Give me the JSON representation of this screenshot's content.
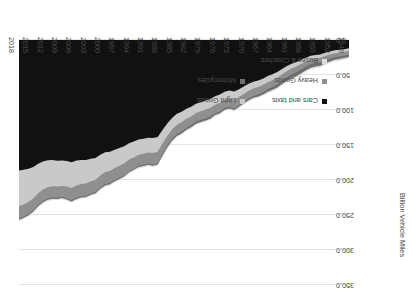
{
  "chart_data": {
    "type": "area",
    "title": "",
    "subtitle": "",
    "xlabel": "",
    "ylabel": "Billion Vehicle Miles",
    "ylim": [
      0,
      350
    ],
    "yticks": [
      "0.0",
      "50.0",
      "100.0",
      "150.0",
      "200.0",
      "250.0",
      "300.0",
      "350.0"
    ],
    "ytick_values": [
      0,
      50,
      100,
      150,
      200,
      250,
      300,
      350
    ],
    "grid": true,
    "legend_position": "lower-right",
    "orientation": "rotated-180",
    "xtick_labels": [
      "1949",
      "1952",
      "1955",
      "1958",
      "1961",
      "1964",
      "1967",
      "1970",
      "1973",
      "1976",
      "1979",
      "1982",
      "1985",
      "1988",
      "1991",
      "1994",
      "1997",
      "2000",
      "2003",
      "2006",
      "2009",
      "2012",
      "2015",
      "2018"
    ],
    "x": [
      1949,
      1950,
      1951,
      1952,
      1953,
      1954,
      1955,
      1956,
      1957,
      1958,
      1959,
      1960,
      1961,
      1962,
      1963,
      1964,
      1965,
      1966,
      1967,
      1968,
      1969,
      1970,
      1971,
      1972,
      1973,
      1974,
      1975,
      1976,
      1977,
      1978,
      1979,
      1980,
      1981,
      1982,
      1983,
      1984,
      1985,
      1986,
      1987,
      1988,
      1989,
      1990,
      1991,
      1992,
      1993,
      1994,
      1995,
      1996,
      1997,
      1998,
      1999,
      2000,
      2001,
      2002,
      2003,
      2004,
      2005,
      2006,
      2007,
      2008,
      2009,
      2010,
      2011,
      2012,
      2013,
      2014,
      2015,
      2016,
      2017,
      2018
    ],
    "series": [
      {
        "name": "Cars and taxis",
        "color": "#111111",
        "values": [
          11.9,
          13.2,
          14.0,
          14.8,
          16.5,
          18.3,
          20.6,
          21.5,
          22.4,
          25.2,
          28.2,
          31.3,
          34.0,
          37.3,
          41.3,
          45.7,
          48.9,
          51.6,
          55.2,
          57.7,
          59.5,
          62.4,
          66.5,
          70.3,
          73.6,
          72.2,
          74.0,
          78.0,
          80.2,
          84.4,
          86.3,
          88.8,
          91.2,
          95.4,
          98.2,
          102.5,
          105.4,
          111.4,
          119.2,
          128.4,
          138.6,
          140.0,
          139.6,
          141.0,
          142.2,
          145.1,
          147.5,
          151.8,
          154.4,
          156.7,
          159.5,
          160.4,
          164.0,
          168.5,
          169.8,
          171.5,
          171.6,
          172.3,
          174.6,
          173.0,
          172.3,
          172.4,
          171.4,
          171.9,
          173.5,
          176.8,
          181.3,
          184.0,
          185.5,
          186.5
        ]
      },
      {
        "name": "Light Goods",
        "color": "#c9c9c9",
        "values": [
          3.6,
          3.8,
          4.0,
          4.1,
          4.3,
          4.6,
          4.9,
          5.0,
          5.2,
          5.6,
          6.0,
          6.5,
          6.8,
          7.2,
          7.7,
          8.2,
          8.5,
          8.8,
          9.2,
          9.5,
          9.7,
          10.1,
          10.6,
          11.1,
          11.7,
          11.5,
          11.5,
          11.9,
          12.2,
          12.7,
          13.0,
          13.0,
          13.2,
          13.8,
          14.4,
          15.0,
          15.7,
          16.6,
          18.0,
          19.6,
          21.2,
          21.5,
          21.2,
          21.5,
          21.8,
          22.6,
          23.3,
          24.4,
          25.3,
          26.2,
          27.5,
          28.3,
          29.5,
          31.0,
          32.1,
          33.4,
          34.2,
          35.4,
          36.8,
          36.3,
          36.2,
          37.0,
          37.6,
          38.6,
          40.2,
          42.2,
          45.0,
          47.6,
          49.5,
          51.1
        ]
      },
      {
        "name": "Heavy Goods",
        "color": "#8f8f8f",
        "values": [
          5.2,
          5.4,
          5.6,
          5.7,
          5.9,
          6.2,
          6.6,
          6.5,
          6.7,
          7.1,
          7.6,
          8.1,
          8.4,
          8.6,
          9.0,
          9.5,
          9.8,
          10.0,
          10.3,
          10.6,
          10.8,
          11.2,
          11.5,
          11.8,
          12.4,
          12.0,
          11.7,
          12.1,
          12.3,
          12.6,
          12.9,
          12.3,
          12.0,
          12.4,
          12.7,
          13.1,
          13.3,
          13.6,
          14.3,
          15.3,
          16.2,
          16.3,
          15.7,
          15.7,
          15.8,
          16.2,
          16.6,
          17.0,
          17.2,
          17.2,
          17.4,
          17.3,
          17.3,
          17.5,
          17.4,
          17.6,
          17.4,
          17.5,
          17.6,
          17.0,
          15.6,
          16.1,
          16.1,
          16.0,
          16.3,
          16.8,
          17.0,
          17.2,
          17.3,
          17.4
        ]
      },
      {
        "name": "Motorcycles",
        "color": "#6e6e6e",
        "values": [
          3.1,
          3.3,
          3.5,
          3.6,
          3.9,
          4.2,
          4.6,
          4.9,
          5.2,
          5.4,
          5.8,
          5.9,
          5.6,
          5.2,
          4.8,
          4.4,
          4.0,
          3.6,
          3.2,
          2.9,
          2.6,
          2.4,
          2.2,
          2.1,
          2.2,
          2.3,
          2.4,
          2.5,
          2.6,
          2.7,
          2.8,
          3.2,
          3.3,
          3.2,
          3.0,
          2.8,
          2.6,
          2.4,
          2.2,
          2.1,
          2.0,
          1.9,
          1.8,
          1.7,
          1.6,
          1.6,
          1.6,
          1.6,
          1.6,
          1.6,
          1.7,
          1.8,
          1.8,
          1.8,
          1.8,
          1.8,
          1.8,
          1.8,
          1.8,
          1.7,
          1.7,
          1.7,
          1.7,
          1.7,
          1.7,
          1.7,
          1.7,
          1.7,
          1.7,
          1.7
        ]
      },
      {
        "name": "Buses & Coaches",
        "color": "#dcdcdc",
        "values": [
          2.4,
          2.4,
          2.4,
          2.4,
          2.4,
          2.3,
          2.3,
          2.3,
          2.2,
          2.2,
          2.2,
          2.1,
          2.1,
          2.1,
          2.0,
          2.0,
          2.0,
          2.0,
          1.9,
          1.9,
          1.9,
          1.9,
          1.8,
          1.8,
          1.8,
          1.8,
          1.8,
          1.8,
          1.8,
          1.8,
          1.8,
          1.8,
          1.8,
          1.8,
          1.8,
          1.8,
          1.8,
          1.8,
          1.8,
          1.8,
          1.8,
          1.8,
          1.8,
          1.8,
          1.8,
          1.8,
          1.8,
          1.8,
          1.8,
          1.8,
          1.8,
          1.8,
          1.8,
          1.8,
          1.8,
          1.8,
          1.8,
          1.8,
          1.8,
          1.8,
          1.8,
          1.8,
          1.8,
          1.8,
          1.8,
          1.8,
          1.8,
          1.8,
          1.8,
          1.8
        ]
      }
    ]
  },
  "axis": {
    "y_title": "Billion Vehicle Miles",
    "y_ticks": [
      "0.0",
      "50.0",
      "100.0",
      "150.0",
      "200.0",
      "250.0",
      "300.0",
      "350.0"
    ],
    "x_ticks": [
      "1949",
      "1952",
      "1955",
      "1958",
      "1961",
      "1964",
      "1967",
      "1970",
      "1973",
      "1976",
      "1979",
      "1982",
      "1985",
      "1988",
      "1991",
      "1994",
      "1997",
      "2000",
      "2003",
      "2006",
      "2009",
      "2012",
      "2015",
      "2018"
    ]
  },
  "legend": {
    "items": [
      {
        "label": "Cars and taxis",
        "color": "#111111"
      },
      {
        "label": "Light Goods",
        "color": "#c9c9c9"
      },
      {
        "label": "Heavy Goods",
        "color": "#8f8f8f"
      },
      {
        "label": "Motorcycles",
        "color": "#6e6e6e"
      },
      {
        "label": "Buses & Coaches",
        "color": "#dcdcdc"
      }
    ]
  }
}
